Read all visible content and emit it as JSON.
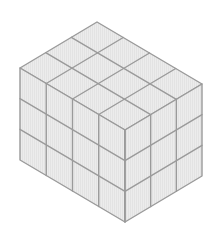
{
  "figure": {
    "dimensions": {
      "width_left_face": 4,
      "width_right_face": 3,
      "height": 3
    },
    "cube_count": 36,
    "colors": {
      "background": "#ffffff",
      "face_fill": "#ececec",
      "stripe": "#e2e2e2",
      "edge": "#9a9a9a"
    },
    "geometry": {
      "top_vertex": [
        97,
        22
      ],
      "u_vector": [
        -25.67,
        15.33
      ],
      "v_vector": [
        26.25,
        15.5
      ],
      "unit_height": 30.67
    }
  }
}
